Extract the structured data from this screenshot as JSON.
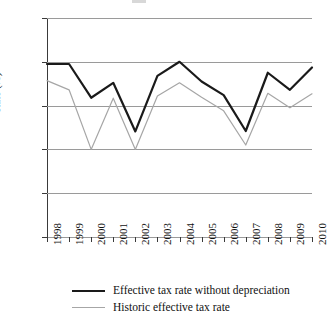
{
  "chart_data": {
    "type": "line",
    "title": "",
    "subtitle": "",
    "xlabel": "",
    "ylabel": "Rate (%)",
    "categories": [
      "1998",
      "1999",
      "2000",
      "2001",
      "2002",
      "2003",
      "2004",
      "2005",
      "2006",
      "2007",
      "2008",
      "2009",
      "2010"
    ],
    "x": [
      1998,
      1999,
      2000,
      2001,
      2002,
      2003,
      2004,
      2005,
      2006,
      2007,
      2008,
      2009,
      2010
    ],
    "ylim": [
      30,
      35
    ],
    "yticks": [
      30,
      31,
      32,
      33,
      34,
      35
    ],
    "ytick_labels": [
      "30",
      "31",
      "32",
      "33",
      "34",
      "35"
    ],
    "grid": true,
    "grid_axis": "y",
    "legend_position": "bottom",
    "series": [
      {
        "name": "Effective tax rate without depreciation",
        "color": "#1a1a1a",
        "width": 2.2,
        "values": [
          33.95,
          33.95,
          33.18,
          33.52,
          32.41,
          33.68,
          34.0,
          33.55,
          33.24,
          32.42,
          33.75,
          33.36,
          33.87
        ]
      },
      {
        "name": "Historic effective tax rate",
        "color": "#a6a6a6",
        "width": 1.2,
        "values": [
          33.57,
          33.36,
          32.0,
          33.17,
          32.0,
          33.22,
          33.52,
          33.19,
          32.88,
          32.1,
          33.28,
          32.95,
          33.27
        ]
      }
    ]
  },
  "legend": {
    "items": [
      {
        "label": "Effective tax rate without depreciation"
      },
      {
        "label": "Historic effective tax rate"
      }
    ]
  },
  "axes": {
    "y_title": "Rate (%)"
  }
}
